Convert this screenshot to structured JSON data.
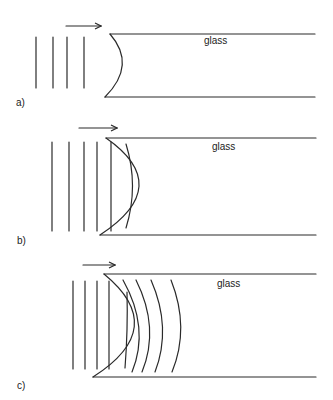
{
  "figure": {
    "panels": [
      {
        "id": "a",
        "label": "a)",
        "label_pos": [
          16,
          98
        ],
        "material_label": "glass",
        "material_pos": [
          204,
          36
        ],
        "arrow": [
          66,
          26,
          101,
          26
        ],
        "interface_top": [
          110,
          34,
          315,
          34
        ],
        "interface_bottom": [
          105,
          97,
          315,
          97
        ],
        "interface_curve": "M110,34 Q137,65 105,97",
        "wavefronts_straight": [
          36,
          53,
          67,
          84
        ],
        "wavefront_y": [
          37,
          88
        ],
        "wavefronts_curved": []
      },
      {
        "id": "b",
        "label": "b)",
        "label_pos": [
          17,
          236
        ],
        "material_label": "glass",
        "material_pos": [
          212,
          142
        ],
        "arrow": [
          79,
          128,
          117,
          128
        ],
        "interface_top": [
          106,
          138,
          316,
          138
        ],
        "interface_bottom": [
          100,
          235,
          316,
          235
        ],
        "interface_curve": "M106,138 Q175,186 100,235",
        "wavefronts_straight": [
          52,
          69,
          84,
          97,
          111
        ],
        "wavefront_y": [
          142,
          231
        ],
        "wavefronts_curved": [
          "M126,144 Q139,186 126,228"
        ]
      },
      {
        "id": "c",
        "label": "c)",
        "label_pos": [
          17,
          381
        ],
        "material_label": "glass",
        "material_pos": [
          217,
          279
        ],
        "arrow": [
          83,
          265,
          115,
          265
        ],
        "interface_top": [
          104,
          274,
          316,
          274
        ],
        "interface_bottom": [
          93,
          377,
          316,
          377
        ],
        "interface_curve": "M104,274 Q170,328 93,377",
        "wavefronts_straight": [
          73,
          85,
          97,
          109
        ],
        "wavefront_y": [
          281,
          369
        ],
        "wavefronts_curved": [
          "M127,292 Q128,330 125,368",
          "M123,280 Q150,328 132,372",
          "M136,280 Q160,328 142,372",
          "M151,280 Q172,328 155,372",
          "M171,280 Q190,328 172,372"
        ]
      }
    ]
  }
}
